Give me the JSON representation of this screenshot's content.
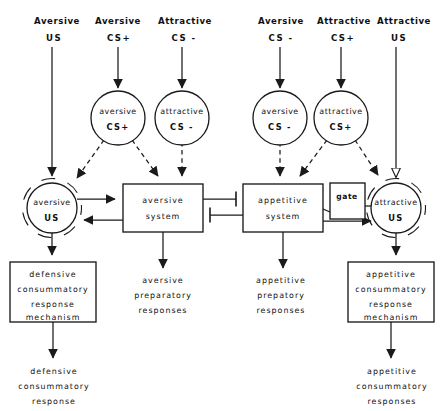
{
  "diagram": {
    "stroke_color": "#1a1a1a",
    "background_color": "#ffffff"
  },
  "top_inputs": [
    {
      "id": "in1",
      "qualifier": "Aversive",
      "signal": "US",
      "x": 57,
      "arrow": "none"
    },
    {
      "id": "in2",
      "qualifier": "Aversive",
      "signal": "CS+",
      "x": 118,
      "arrow": "solid-down"
    },
    {
      "id": "in3",
      "qualifier": "Attractive",
      "signal": "CS -",
      "x": 182,
      "arrow": "solid-down"
    },
    {
      "id": "in4",
      "qualifier": "Aversive",
      "signal": "CS -",
      "x": 280,
      "arrow": "solid-down"
    },
    {
      "id": "in5",
      "qualifier": "Attractive",
      "signal": "CS+",
      "x": 341,
      "arrow": "solid-down"
    },
    {
      "id": "in6",
      "qualifier": "Attractive",
      "signal": "US",
      "x": 399,
      "arrow": "none"
    }
  ],
  "cs_nodes": [
    {
      "id": "cs_av_plus",
      "line1": "aversive",
      "line2": "CS+",
      "cx": 118,
      "cy": 118
    },
    {
      "id": "cs_at_minus",
      "line1": "attractive",
      "line2": "CS -",
      "cx": 182,
      "cy": 118
    },
    {
      "id": "cs_av_minus",
      "line1": "aversive",
      "line2": "CS -",
      "cx": 280,
      "cy": 118
    },
    {
      "id": "cs_at_plus",
      "line1": "attractive",
      "line2": "CS+",
      "cx": 341,
      "cy": 118
    }
  ],
  "us_nodes": [
    {
      "id": "us_aversive",
      "line1": "aversive",
      "line2": "US",
      "cx": 52,
      "cy": 208
    },
    {
      "id": "us_attractive",
      "line1": "attractive",
      "line2": "US",
      "cx": 396,
      "cy": 208
    }
  ],
  "system_boxes": [
    {
      "id": "aversive_system",
      "line1": "aversive",
      "line2": "system",
      "x": 123,
      "y": 184,
      "w": 80,
      "h": 48
    },
    {
      "id": "appetitive_system",
      "line1": "appetitive",
      "line2": "system",
      "x": 243,
      "y": 184,
      "w": 80,
      "h": 48
    }
  ],
  "gate": {
    "id": "gate",
    "label": "gate",
    "x": 330,
    "y": 183,
    "w": 35,
    "h": 36
  },
  "mechanism_boxes": [
    {
      "id": "defensive_mechanism",
      "x": 10,
      "y": 262,
      "w": 86,
      "h": 60,
      "lines": [
        "defensive",
        "consummatory",
        "response",
        "mechanism"
      ]
    },
    {
      "id": "appetitive_mechanism",
      "x": 348,
      "y": 262,
      "w": 86,
      "h": 60,
      "lines": [
        "appetitive",
        "consummatory",
        "response",
        "mechanism"
      ]
    }
  ],
  "output_labels": [
    {
      "id": "aversive_preparatory",
      "x": 130,
      "y": 276,
      "lines": [
        "aversive",
        "preparatory",
        "responses"
      ]
    },
    {
      "id": "appetitive_preparatory",
      "x": 240,
      "y": 276,
      "lines": [
        "appetitive",
        "prepatory",
        "responses"
      ]
    },
    {
      "id": "defensive_response",
      "x": 14,
      "y": 365,
      "lines": [
        "defensive",
        "consummatory",
        "response"
      ]
    },
    {
      "id": "appetitive_response",
      "x": 352,
      "y": 365,
      "lines": [
        "appetitive",
        "consummatory",
        "responses"
      ]
    }
  ],
  "connections": {
    "inhibitory_pairs": 2,
    "dashed_links": 6,
    "solid_links": 14
  }
}
